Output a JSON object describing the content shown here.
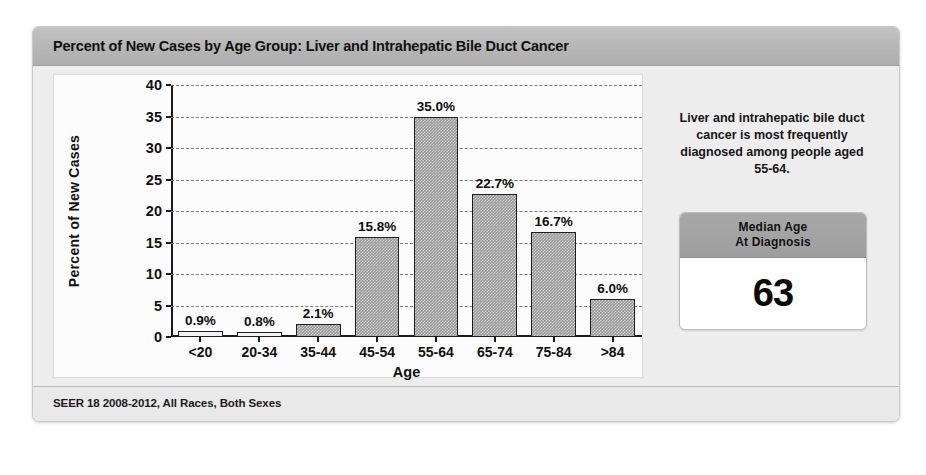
{
  "card": {
    "title": "Percent of New Cases by Age Group: Liver and Intrahepatic Bile Duct Cancer",
    "footer": "SEER 18 2008-2012, All Races, Both Sexes"
  },
  "side_panel": {
    "note": "Liver and intrahepatic bile duct cancer is most frequently diagnosed among people aged 55-64.",
    "stat_title_line1": "Median Age",
    "stat_title_line2": "At Diagnosis",
    "stat_value": "63"
  },
  "colors": {
    "bar_fill": "#9b9b9b",
    "bar_outline": "#1f1f1f",
    "header_band": "#b6b6b6",
    "panel_bg": "#ededed",
    "plot_bg": "#fcfcfc"
  },
  "chart_data": {
    "type": "bar",
    "title": "Percent of New Cases by Age Group: Liver and Intrahepatic Bile Duct Cancer",
    "xlabel": "Age",
    "ylabel": "Percent of New Cases",
    "categories": [
      "<20",
      "20-34",
      "35-44",
      "45-54",
      "55-64",
      "65-74",
      "75-84",
      ">84"
    ],
    "values": [
      0.9,
      0.8,
      2.1,
      15.8,
      35.0,
      22.7,
      16.7,
      6.0
    ],
    "data_labels": [
      "0.9%",
      "0.8%",
      "2.1%",
      "15.8%",
      "35.0%",
      "22.7%",
      "16.7%",
      "6.0%"
    ],
    "ylim": [
      0,
      40
    ],
    "yticks": [
      0,
      5,
      10,
      15,
      20,
      25,
      30,
      35,
      40
    ],
    "ytick_labels": [
      "0",
      "5",
      "10",
      "15",
      "20",
      "25",
      "30",
      "35",
      "40"
    ],
    "grid": "horizontal-dashed",
    "legend": "none",
    "source": "SEER 18 2008-2012, All Races, Both Sexes"
  }
}
